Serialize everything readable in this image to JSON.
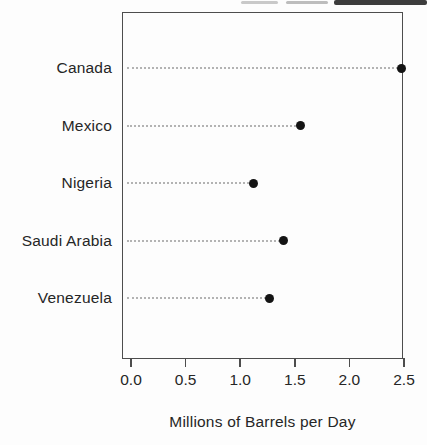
{
  "chart_data": {
    "type": "scatter",
    "variant": "cleveland-dot-plot",
    "orientation": "horizontal",
    "title": "",
    "xlabel": "Millions of Barrels per Day",
    "ylabel": "",
    "categories": [
      "Canada",
      "Mexico",
      "Nigeria",
      "Saudi Arabia",
      "Venezuela"
    ],
    "values": [
      2.48,
      1.55,
      1.12,
      1.4,
      1.27
    ],
    "xlim": [
      0,
      2.5
    ],
    "xticks": [
      0,
      0.5,
      1,
      1.5,
      2,
      2.5
    ],
    "xtick_labels": [
      "0.0",
      "0.5",
      "1.0",
      "1.5",
      "2.0",
      "2.5"
    ],
    "grid": "dotted-leader-lines",
    "legend": "none",
    "colors": {
      "dot": "#141414",
      "leader_line": "#b3b3b3",
      "frame": "#4d4d4d",
      "text": "#262626",
      "background": "#fdfdfd"
    }
  },
  "decorations": {
    "cropped_text_remnant": "unreadable cut-off text strip along top-right edge"
  }
}
